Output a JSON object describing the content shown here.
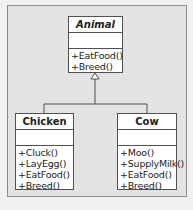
{
  "diagram": {
    "type": "uml-class-diagram",
    "classes": [
      {
        "id": "animal",
        "name": "Animal",
        "abstract": true,
        "attributes": [],
        "operations": [
          "+EatFood()",
          "+Breed()"
        ]
      },
      {
        "id": "chicken",
        "name": "Chicken",
        "abstract": false,
        "attributes": [],
        "operations": [
          "+Cluck()",
          "+LayEgg()",
          "+EatFood()",
          "+Breed()"
        ]
      },
      {
        "id": "cow",
        "name": "Cow",
        "abstract": false,
        "attributes": [],
        "operations": [
          "+Moo()",
          "+SupplyMilk()",
          "+EatFood()",
          "+Breed()"
        ]
      }
    ],
    "relationships": [
      {
        "type": "generalization",
        "from": "Chicken",
        "to": "Animal",
        "arrow": "hollow-triangle-icon"
      },
      {
        "type": "generalization",
        "from": "Cow",
        "to": "Animal",
        "arrow": "hollow-triangle-icon"
      }
    ],
    "colors": {
      "background": "#e3e3e3",
      "box_fill": "#ffffff",
      "line": "#505050"
    }
  }
}
